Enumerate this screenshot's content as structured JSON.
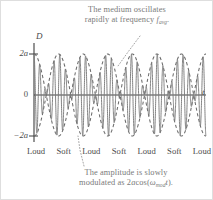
{
  "figure": {
    "title_top_caption_line1": "The medium oscillates",
    "title_top_caption_line2_pre": "rapidly at frequency ",
    "top_caption_symbol": "f",
    "top_caption_symbol_sub": "avg",
    "top_caption_symbol_post": ".",
    "bottom_caption_line1": "The amplitude is slowly",
    "bottom_caption_line2_pre": "modulated as 2",
    "bottom_caption_a": "a",
    "bottom_caption_cos": "cos(",
    "bottom_caption_omega": "ω",
    "bottom_caption_omega_sub": "mod",
    "bottom_caption_t": "t",
    "bottom_caption_end": ")."
  },
  "axes": {
    "y_axis_label": "D",
    "x_axis_label": "t",
    "y_ticks": [
      {
        "label": "2a",
        "value": 2
      },
      {
        "label": "0",
        "value": 0
      },
      {
        "label": "−2a",
        "value": -2
      }
    ],
    "y_range": [
      -2.45,
      2.45
    ],
    "x_range": [
      0,
      1
    ]
  },
  "region_labels": [
    "Loud",
    "Soft",
    "Loud",
    "Soft",
    "Loud",
    "Soft",
    "Loud"
  ],
  "colors": {
    "wave": "#7b7b7b",
    "envelope": "#6a6a6a",
    "axis": "#3d3d3d",
    "caption_text": "#7a7a7a",
    "label_text": "#4a4a4a",
    "background": "#ffffff",
    "border": "#d9d9d9"
  },
  "chart_data": {
    "type": "line",
    "xlabel": "t",
    "ylabel": "D",
    "ylim": [
      -2.45,
      2.45
    ],
    "xlim": [
      0,
      1
    ],
    "grid": false,
    "legend": "none",
    "series": [
      {
        "name": "carrier",
        "description": "D = 2a cos(omega_mod t) cos(omega_avg t)",
        "carrier_cycles": 30,
        "modulation_cycles": 3.5,
        "amplitude": 2,
        "style": "solid"
      },
      {
        "name": "upper envelope",
        "description": "+2a cos(omega_mod t)",
        "style": "dashed"
      },
      {
        "name": "lower envelope",
        "description": "-2a cos(omega_mod t)",
        "style": "dashed"
      }
    ],
    "envelope_maxima_count": 4,
    "envelope_minima_count": 3,
    "annotations": [
      {
        "text": "The medium oscillates rapidly at frequency f_avg",
        "position": "top",
        "leader": "dotted"
      },
      {
        "text": "The amplitude is slowly modulated as 2a cos(omega_mod t).",
        "position": "bottom",
        "leader": "dotted"
      }
    ]
  }
}
